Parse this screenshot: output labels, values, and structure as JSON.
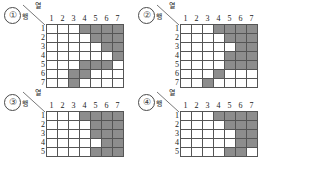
{
  "figure": {
    "grid_size": 7,
    "shade_color": "#8d8d8d",
    "empty_color": "#ffffff",
    "line_color": "#555555"
  },
  "labels": {
    "column_header": "열",
    "row_header": "행",
    "column_numbers": [
      "1",
      "2",
      "3",
      "4",
      "5",
      "6",
      "7"
    ],
    "row_numbers": [
      "1",
      "2",
      "3",
      "4",
      "5",
      "6",
      "7"
    ]
  },
  "panels": [
    {
      "index": "①",
      "visible_rows": 7,
      "cells": [
        [
          0,
          0,
          0,
          1,
          1,
          1,
          1
        ],
        [
          0,
          0,
          0,
          0,
          1,
          1,
          1
        ],
        [
          0,
          0,
          0,
          0,
          0,
          1,
          1
        ],
        [
          0,
          0,
          0,
          0,
          0,
          0,
          1
        ],
        [
          0,
          0,
          0,
          1,
          1,
          1,
          0
        ],
        [
          0,
          0,
          1,
          1,
          0,
          0,
          0
        ],
        [
          0,
          0,
          1,
          0,
          0,
          0,
          0
        ]
      ]
    },
    {
      "index": "②",
      "visible_rows": 7,
      "cells": [
        [
          0,
          0,
          0,
          1,
          1,
          1,
          1
        ],
        [
          0,
          0,
          0,
          0,
          1,
          1,
          1
        ],
        [
          0,
          0,
          0,
          0,
          0,
          1,
          1
        ],
        [
          0,
          0,
          0,
          0,
          1,
          1,
          1
        ],
        [
          0,
          0,
          0,
          0,
          1,
          1,
          1
        ],
        [
          0,
          0,
          0,
          1,
          0,
          0,
          0
        ],
        [
          0,
          0,
          1,
          0,
          0,
          0,
          0
        ]
      ]
    },
    {
      "index": "③",
      "visible_rows": 5,
      "cells": [
        [
          0,
          0,
          0,
          1,
          1,
          1,
          1
        ],
        [
          0,
          0,
          0,
          0,
          1,
          1,
          1
        ],
        [
          0,
          0,
          0,
          0,
          1,
          1,
          1
        ],
        [
          0,
          0,
          0,
          0,
          0,
          1,
          1
        ],
        [
          0,
          0,
          0,
          0,
          1,
          1,
          1
        ]
      ]
    },
    {
      "index": "④",
      "visible_rows": 5,
      "cells": [
        [
          0,
          0,
          0,
          1,
          1,
          1,
          1
        ],
        [
          0,
          0,
          0,
          0,
          1,
          1,
          1
        ],
        [
          0,
          0,
          0,
          0,
          0,
          1,
          1
        ],
        [
          0,
          0,
          0,
          0,
          0,
          1,
          1
        ],
        [
          0,
          0,
          0,
          0,
          1,
          1,
          0
        ]
      ]
    }
  ]
}
